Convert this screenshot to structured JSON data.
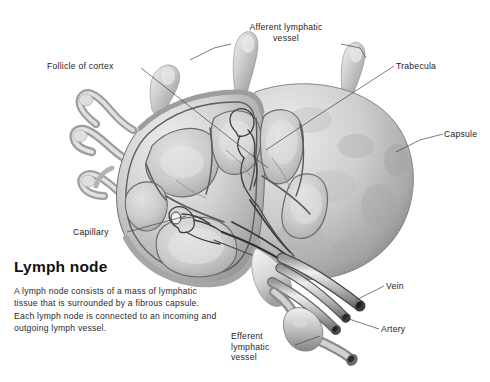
{
  "figure": {
    "background_color": "#ffffff",
    "ink_color": "#1c1c1c",
    "palette": {
      "capsule_light": "#e6e6e6",
      "capsule_mid": "#c2c2c2",
      "capsule_dark": "#8e8e8e",
      "cortex_fill": "#d4d4d4",
      "septa": "#6e6e6e",
      "vessel_light": "#efefef",
      "vessel_mid": "#b5b5b5",
      "vessel_dark": "#5f5f5f",
      "leader_line": "#444444"
    }
  },
  "labels": [
    {
      "id": "afferent-lymphatic-vessel",
      "text": "Afferent lymphatic\nvessel",
      "align": "center",
      "x": 232,
      "y": 22,
      "width": 108
    },
    {
      "id": "follicle-of-cortex",
      "text": "Follicle of cortex",
      "align": "left",
      "x": 47,
      "y": 61,
      "width": 92
    },
    {
      "id": "trabecula",
      "text": "Trabecula",
      "align": "left",
      "x": 396,
      "y": 61,
      "width": 60
    },
    {
      "id": "capsule",
      "text": "Capsule",
      "align": "left",
      "x": 444,
      "y": 129,
      "width": 48
    },
    {
      "id": "capillary",
      "text": "Capillary",
      "align": "left",
      "x": 73,
      "y": 227,
      "width": 52
    },
    {
      "id": "vein",
      "text": "Vein",
      "align": "left",
      "x": 386,
      "y": 281,
      "width": 32
    },
    {
      "id": "artery",
      "text": "Artery",
      "align": "left",
      "x": 381,
      "y": 324,
      "width": 40
    },
    {
      "id": "efferent-lymphatic-vessel",
      "text": "Efferent\nlymphatic\nvessel",
      "align": "left",
      "x": 231,
      "y": 331,
      "width": 62
    }
  ],
  "caption": {
    "title": "Lymph node",
    "body": "A lymph node consists of a mass of lymphatic tissue that is surrounded by a fibrous capsule. Each lymph node is connected to an incoming and outgoing lymph vessel."
  }
}
